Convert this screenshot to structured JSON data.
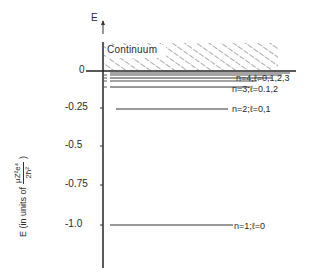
{
  "diagram": {
    "axis": {
      "label": "E",
      "ylabel_prefix": "E  (in  units of",
      "ylabel_fraction_num": "μZ²e⁴",
      "ylabel_fraction_den": "2ħ²",
      "ylabel_suffix": ")",
      "ticks": [
        {
          "value": 0,
          "label": "0"
        },
        {
          "value": -0.25,
          "label": "-0.25"
        },
        {
          "value": -0.5,
          "label": "-0.5"
        },
        {
          "value": -0.75,
          "label": "-0.75"
        },
        {
          "value": -1.0,
          "label": "-1.0"
        }
      ]
    },
    "continuum_label": "Continuum",
    "levels": [
      {
        "n": 1,
        "energy": -1.0,
        "label": "n=1;ℓ=0"
      },
      {
        "n": 2,
        "energy": -0.25,
        "label": "n=2;ℓ=0,1"
      },
      {
        "n": 3,
        "energy": -0.111,
        "label": "n=3;ℓ=0.1,2"
      },
      {
        "n": 4,
        "energy": -0.0625,
        "label": "n=4,ℓ=0,1,2,3"
      }
    ]
  }
}
